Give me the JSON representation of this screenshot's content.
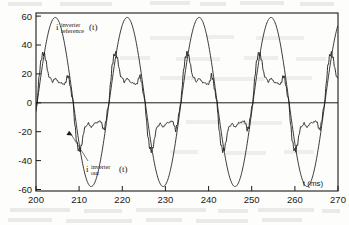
{
  "figure": {
    "kind": "line-plot",
    "background_color": "#fdfdfb",
    "ink_color": "#1a1a1a",
    "frame": {
      "left_px": 36,
      "top_px": 13,
      "right_px": 338,
      "bottom_px": 191
    },
    "ghost_text_present": true
  },
  "chart_data": {
    "type": "line",
    "title": "",
    "subtitle": "",
    "xlabel": "t (ms)",
    "ylabel": "",
    "xlim": [
      200,
      270
    ],
    "ylim": [
      -60,
      60
    ],
    "xticks": [
      200,
      210,
      220,
      230,
      240,
      250,
      260,
      270
    ],
    "xticklabels": [
      "200",
      "210",
      "220",
      "230",
      "240",
      "250",
      "260",
      "270"
    ],
    "yticks": [
      -60,
      -40,
      -20,
      0,
      20,
      40,
      60
    ],
    "yticklabels": [
      "-60",
      "-40",
      "-20",
      "0",
      "20",
      "40",
      "60"
    ],
    "grid": false,
    "legend_position": "inline-annotation",
    "zero_line": true,
    "series": [
      {
        "name": "i_reference^inverter(t)",
        "label_base": "i",
        "label_superscript": "inverter",
        "label_subscript": "reference",
        "label_suffix": "(t)",
        "style": "smooth sinusoid",
        "waveform": "sine",
        "amplitude": 57,
        "period_ms": 16.67,
        "frequency_hz": 60,
        "phase_zero_crossing_ms": 200.3,
        "peaks_ms": [
          204.5,
          221.2,
          237.8,
          254.5,
          271.1
        ],
        "troughs_ms": [
          212.9,
          229.5,
          246.2,
          262.8
        ],
        "peak_value": 57,
        "trough_value": -57
      },
      {
        "name": "i_out^inverter(t)",
        "label_base": "i",
        "label_superscript": "inverter",
        "label_subscript": "out",
        "label_suffix": "(t)",
        "style": "stepped / hysteresis-band current with switching ripple",
        "peak_value": 33,
        "plateau_1_value": 17,
        "plateau_2_value": 13,
        "negative_peak_value": -33,
        "negative_plateau_1_value": -17,
        "negative_plateau_2_value": -14,
        "ripple_band": 4,
        "period_ms": 16.67
      }
    ],
    "annotations": [
      {
        "id": "reference-label",
        "text": "i_reference^inverter (t)",
        "x_ms": 203.5,
        "y_value": 49
      },
      {
        "id": "output-label",
        "text": "i_out^inverter (t)",
        "x_ms": 211.5,
        "y_value": -43,
        "leader_line": true,
        "arrow_target_x_ms": 208.0,
        "arrow_target_y_value": -24
      },
      {
        "id": "x-axis-units",
        "text": "t (ms)",
        "x_ms": 265.0,
        "y_value": -55
      }
    ]
  }
}
